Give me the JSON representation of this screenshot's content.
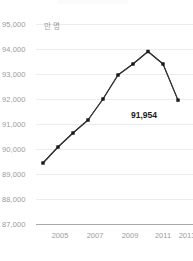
{
  "chart_data": {
    "type": "line",
    "title": "",
    "xlabel": "",
    "ylabel": "",
    "unit_label": "만 명",
    "grid": true,
    "legend": "none",
    "ylim": [
      87000,
      95000
    ],
    "y_ticks": [
      95000,
      94000,
      93000,
      92000,
      91000,
      90000,
      89000,
      88000,
      87000
    ],
    "y_tick_labels": [
      "95,000",
      "94,000",
      "93,000",
      "92,000",
      "91,000",
      "90,000",
      "89,000",
      "88,000",
      "87,000"
    ],
    "xlim": [
      2004,
      2013
    ],
    "x_ticks": [
      2005,
      2007,
      2009,
      2011,
      2013
    ],
    "x_tick_labels": [
      "2005",
      "2007",
      "2009",
      "2011",
      "2013"
    ],
    "x": [
      2004,
      2005,
      2006,
      2007,
      2008,
      2009,
      2010,
      2011,
      2012,
      2013
    ],
    "values": [
      89440,
      90080,
      90640,
      91160,
      92000,
      92960,
      93400,
      93900,
      93400,
      91954
    ],
    "annotations": [
      {
        "label": "91,954",
        "x": 2013,
        "y": 91954
      }
    ],
    "line_color": "#333333",
    "marker_color": "#1a1a1a",
    "grid_color": "#ececec",
    "axis_color": "#a8a8a8",
    "tick_text_color": "#9b9b9b",
    "background": "#ffffff"
  },
  "axis": {
    "y_labels": [
      "95,000",
      "94,000",
      "93,000",
      "92,000",
      "91,000",
      "90,000",
      "89,000",
      "88,000",
      "87,000"
    ],
    "x_labels": [
      "2005",
      "2007",
      "2009",
      "2011",
      "2013"
    ],
    "unit": "만 명"
  },
  "annotation": {
    "last_value": "91,954"
  }
}
